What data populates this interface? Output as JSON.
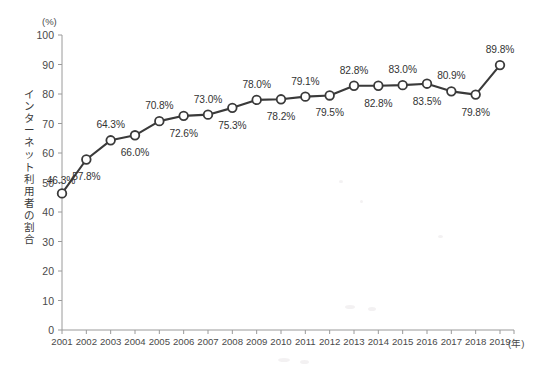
{
  "chart_data": {
    "type": "line",
    "title": "",
    "subtitle": "",
    "xlabel": "(年)",
    "ylabel": "インターネット利用者の割合",
    "unit_label": "(%)",
    "ylim": [
      0,
      100
    ],
    "ytick_step": 10,
    "grid": false,
    "legend": "none",
    "marker": "open-circle",
    "line_color": "#3a3a3a",
    "marker_fill": "#ffffff",
    "categories": [
      "2001",
      "2002",
      "2003",
      "2004",
      "2005",
      "2006",
      "2007",
      "2008",
      "2009",
      "2010",
      "2011",
      "2012",
      "2013",
      "2014",
      "2015",
      "2016",
      "2017",
      "2018",
      "2019"
    ],
    "values": [
      46.3,
      57.8,
      64.3,
      66.0,
      70.8,
      72.6,
      73.0,
      75.3,
      78.0,
      78.2,
      79.1,
      79.5,
      82.8,
      82.8,
      83.0,
      83.5,
      80.9,
      79.8,
      89.8
    ],
    "point_labels": [
      "46.3%",
      "57.8%",
      "64.3%",
      "66.0%",
      "70.8%",
      "72.6%",
      "73.0%",
      "75.3%",
      "78.0%",
      "78.2%",
      "79.1%",
      "79.5%",
      "82.8%",
      "82.8%",
      "83.0%",
      "83.5%",
      "80.9%",
      "79.8%",
      "89.8%"
    ],
    "label_positions": [
      "left-below",
      "below",
      "above",
      "below",
      "above",
      "below",
      "above",
      "below",
      "above",
      "below",
      "above",
      "below",
      "above",
      "below",
      "above",
      "below",
      "above",
      "below",
      "above"
    ],
    "yticks": [
      "0",
      "10",
      "20",
      "30",
      "40",
      "50",
      "60",
      "70",
      "80",
      "90",
      "100"
    ],
    "xticks": [
      "2001",
      "2002",
      "2003",
      "2004",
      "2005",
      "2006",
      "2007",
      "2008",
      "2009",
      "2010",
      "2011",
      "2012",
      "2013",
      "2014",
      "2015",
      "2016",
      "2017",
      "2018",
      "2019"
    ]
  },
  "axes": {
    "y_unit": "(%)",
    "y_title": "インターネット利用者の割合",
    "x_unit": "(年)"
  }
}
